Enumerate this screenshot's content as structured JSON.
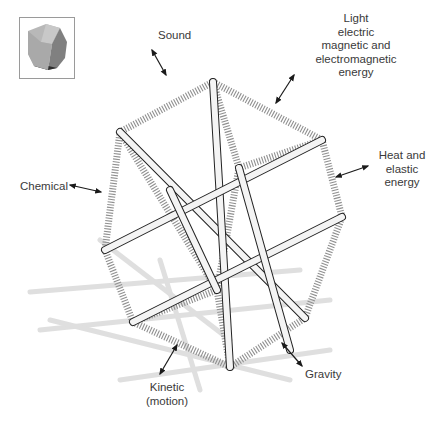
{
  "figure": {
    "inset": {
      "description": "Small shaded polyhedron thumbnail",
      "icon": "polyhedron-icon"
    },
    "labels": {
      "light": [
        "Light",
        "electric",
        "magnetic and",
        "electromagnetic",
        "energy"
      ],
      "sound": "Sound",
      "heat": [
        "Heat and",
        "elastic",
        "energy"
      ],
      "chemical": "Chemical",
      "kinetic": [
        "Kinetic",
        "(motion)"
      ],
      "gravity": "Gravity"
    },
    "colors": {
      "rod_fill": "#f4f4f4",
      "rod_outline": "#222222",
      "spring": "#8a8a8a",
      "shadow": "#d8d8d8",
      "text": "#3a3a3a",
      "arrow": "#1a1a1a"
    }
  }
}
